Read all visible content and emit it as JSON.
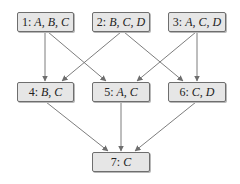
{
  "diagram": {
    "type": "directed-acyclic-graph",
    "colors": {
      "node_fill": "#e6e6e6",
      "node_border": "#6e6e6e",
      "edge": "#6e6e6e"
    },
    "nodes": [
      {
        "id": "1",
        "num": "1:",
        "sets": "A, B, C",
        "x": 17,
        "y": 12,
        "w": 57
      },
      {
        "id": "2",
        "num": "2:",
        "sets": "B, C, D",
        "x": 92,
        "y": 12,
        "w": 58
      },
      {
        "id": "3",
        "num": "3:",
        "sets": "A, C, D",
        "x": 168,
        "y": 12,
        "w": 58
      },
      {
        "id": "4",
        "num": "4:",
        "sets": "B, C",
        "x": 17,
        "y": 82,
        "w": 57
      },
      {
        "id": "5",
        "num": "5:",
        "sets": "A, C",
        "x": 92,
        "y": 82,
        "w": 58
      },
      {
        "id": "6",
        "num": "6:",
        "sets": "C, D",
        "x": 168,
        "y": 82,
        "w": 58
      },
      {
        "id": "7",
        "num": "7:",
        "sets": "C",
        "x": 92,
        "y": 152,
        "w": 58
      }
    ],
    "edges": [
      {
        "from": "1",
        "to": "4"
      },
      {
        "from": "1",
        "to": "5"
      },
      {
        "from": "2",
        "to": "4"
      },
      {
        "from": "2",
        "to": "6"
      },
      {
        "from": "3",
        "to": "5"
      },
      {
        "from": "3",
        "to": "6"
      },
      {
        "from": "4",
        "to": "7"
      },
      {
        "from": "5",
        "to": "7"
      },
      {
        "from": "6",
        "to": "7"
      }
    ]
  }
}
